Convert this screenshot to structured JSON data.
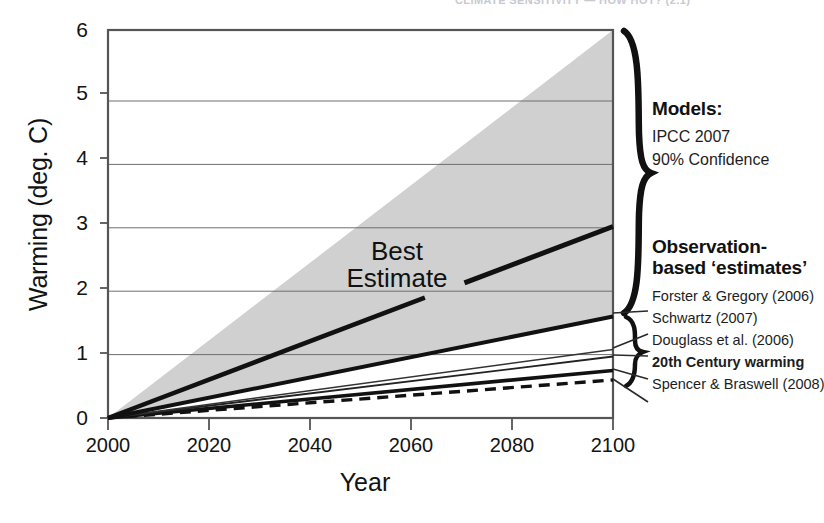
{
  "figure": {
    "clipped_header_text": "CLIMATE SENSITIVITY — HOW HOT? (2.1)",
    "background": "#ffffff"
  },
  "annotations": {
    "best_estimate_line1": "Best",
    "best_estimate_line2": "Estimate"
  },
  "legend": {
    "models": {
      "heading": "Models:",
      "lines": [
        "IPCC 2007",
        "90% Confidence"
      ]
    },
    "observations": {
      "heading_line1": "Observation-",
      "heading_line2": "based ‘estimates’",
      "items": [
        {
          "label": "Forster & Gregory (2006)",
          "bold": false
        },
        {
          "label": "Schwartz (2007)",
          "bold": false
        },
        {
          "label": "Douglass et al. (2006)",
          "bold": false
        },
        {
          "label": "20th Century warming",
          "bold": true
        },
        {
          "label": "Spencer & Braswell (2008)",
          "bold": false
        }
      ]
    }
  },
  "chart_data": {
    "type": "line",
    "title": "",
    "xlabel": "Year",
    "ylabel": "Warming (deg. C)",
    "xlim": [
      1995,
      2102
    ],
    "ylim": [
      -0.05,
      6.15
    ],
    "xticks": [
      2000,
      2020,
      2040,
      2060,
      2080,
      2100
    ],
    "xticklabels": [
      "2000",
      "2020",
      "2040",
      "2060",
      "2080",
      "2100"
    ],
    "yticks": [
      0,
      1,
      2,
      3,
      4,
      5,
      6
    ],
    "yticklabels": [
      "0",
      "1",
      "2",
      "3",
      "4",
      "5",
      "6"
    ],
    "grid": "horizontal",
    "legend_position": "right-outside",
    "x_start": 1998,
    "x_end": 2100,
    "shaded_band": {
      "name": "IPCC 2007 90% Confidence range",
      "color": "#d0d0d0",
      "x": [
        1998,
        2100
      ],
      "upper": [
        0,
        6.12
      ],
      "lower": [
        0,
        1.62
      ]
    },
    "series": [
      {
        "name": "Best Estimate",
        "style": "solid",
        "width": 5,
        "color": "#111111",
        "x": [
          1998,
          2100
        ],
        "values": [
          0,
          3.02
        ],
        "partial_draw_from": 2070,
        "note": "annotation leader segment drawn only near 2100"
      },
      {
        "name": "IPCC mid projection",
        "style": "solid",
        "width": 4.5,
        "color": "#111111",
        "x": [
          1998,
          2062
        ],
        "values": [
          0,
          1.9
        ]
      },
      {
        "name": "Forster & Gregory (2006)",
        "style": "solid",
        "width": 4,
        "color": "#111111",
        "x": [
          1998,
          2100
        ],
        "values": [
          0,
          1.6
        ]
      },
      {
        "name": "Schwartz (2007)",
        "style": "solid",
        "width": 1.4,
        "color": "#333333",
        "x": [
          1998,
          2100
        ],
        "values": [
          0,
          1.08
        ]
      },
      {
        "name": "Douglass et al. (2006)",
        "style": "solid",
        "width": 1.8,
        "color": "#222222",
        "x": [
          1998,
          2100
        ],
        "values": [
          0,
          0.97
        ]
      },
      {
        "name": "20th Century warming",
        "style": "solid",
        "width": 3.6,
        "color": "#111111",
        "x": [
          1998,
          2100
        ],
        "values": [
          0,
          0.75
        ]
      },
      {
        "name": "Spencer & Braswell (2008)",
        "style": "dashed",
        "width": 3.4,
        "color": "#111111",
        "x": [
          1998,
          2100
        ],
        "values": [
          0,
          0.6
        ]
      }
    ]
  }
}
